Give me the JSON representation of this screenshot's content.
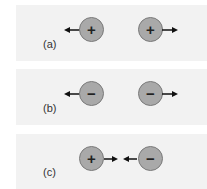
{
  "figure": {
    "panels": [
      {
        "label": "(a)",
        "left_charge": "+",
        "right_charge": "+",
        "force": "repel"
      },
      {
        "label": "(b)",
        "left_charge": "−",
        "right_charge": "−",
        "force": "repel"
      },
      {
        "label": "(c)",
        "left_charge": "+",
        "right_charge": "−",
        "force": "attract"
      }
    ]
  },
  "colors": {
    "panel_bg": "#f2f2f2",
    "charge_fill": "#a9a9a9",
    "arrow": "#111111"
  }
}
